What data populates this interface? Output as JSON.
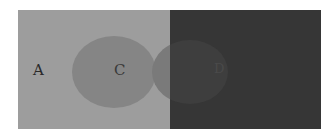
{
  "figure": {
    "regions": [
      {
        "id": "A",
        "label": "A",
        "kind": "light background panel",
        "color": "#9d9d9d"
      },
      {
        "id": "C",
        "label": "C",
        "kind": "circle on light panel",
        "color": "#858585"
      },
      {
        "id": "D",
        "label": "D",
        "kind": "circle on dark panel",
        "color": "#3e3e3e"
      },
      {
        "id": "B",
        "label": "",
        "kind": "dark background panel",
        "color": "#363636"
      }
    ]
  },
  "labels": {
    "a": "A",
    "c": "C",
    "d": "D"
  }
}
